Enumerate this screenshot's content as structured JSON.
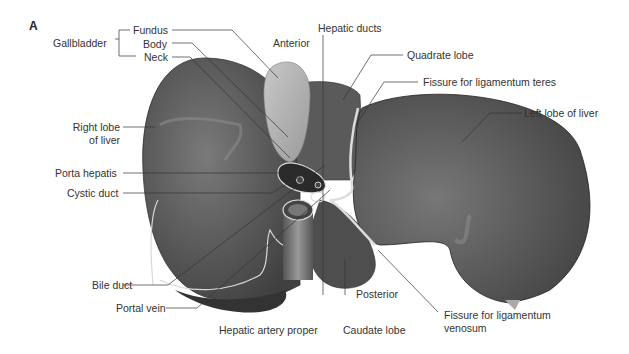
{
  "figure": {
    "panel_letter": "A",
    "view_labels": {
      "anterior": "Anterior",
      "posterior": "Posterior"
    },
    "labels": {
      "gallbladder": "Gallbladder",
      "fundus": "Fundus",
      "body": "Body",
      "neck": "Neck",
      "right_lobe_line1": "Right lobe",
      "right_lobe_line2": "of liver",
      "porta_hepatis": "Porta hepatis",
      "cystic_duct": "Cystic duct",
      "bile_duct": "Bile duct",
      "portal_vein": "Portal vein",
      "hepatic_artery_proper": "Hepatic artery proper",
      "caudate_lobe": "Caudate lobe",
      "fissure_venosum_line1": "Fissure for ligamentum",
      "fissure_venosum_line2": "venosum",
      "left_lobe": "Left lobe of liver",
      "fissure_teres": "Fissure for ligamentum teres",
      "quadrate_lobe": "Quadrate lobe",
      "hepatic_ducts": "Hepatic ducts"
    },
    "colors": {
      "liver_dark": "#4a4a4a",
      "liver_mid": "#6a6a6a",
      "gallbladder": "#b5b5b5",
      "outline_light": "#d8d8d8",
      "leader_line": "#333333",
      "background": "#ffffff"
    }
  }
}
